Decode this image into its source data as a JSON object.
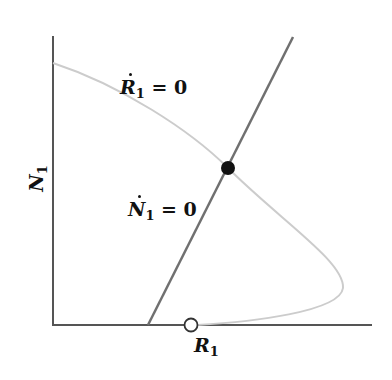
{
  "diagram": {
    "type": "phase-plane",
    "x_axis": {
      "label": "R",
      "subscript": "1"
    },
    "y_axis": {
      "label": "N",
      "subscript": "1"
    },
    "curves": [
      {
        "name": "R-nullcline",
        "label_var": "R",
        "label_sub": "1",
        "label_rhs": "= 0",
        "color": "#c8c8c8"
      },
      {
        "name": "N-nullcline",
        "label_var": "N",
        "label_sub": "1",
        "label_rhs": "= 0",
        "color": "#707070"
      }
    ],
    "points": [
      {
        "name": "stable-equilibrium",
        "style": "filled",
        "color": "#111111"
      },
      {
        "name": "unstable-equilibrium",
        "style": "open",
        "color": "#333333"
      }
    ]
  }
}
